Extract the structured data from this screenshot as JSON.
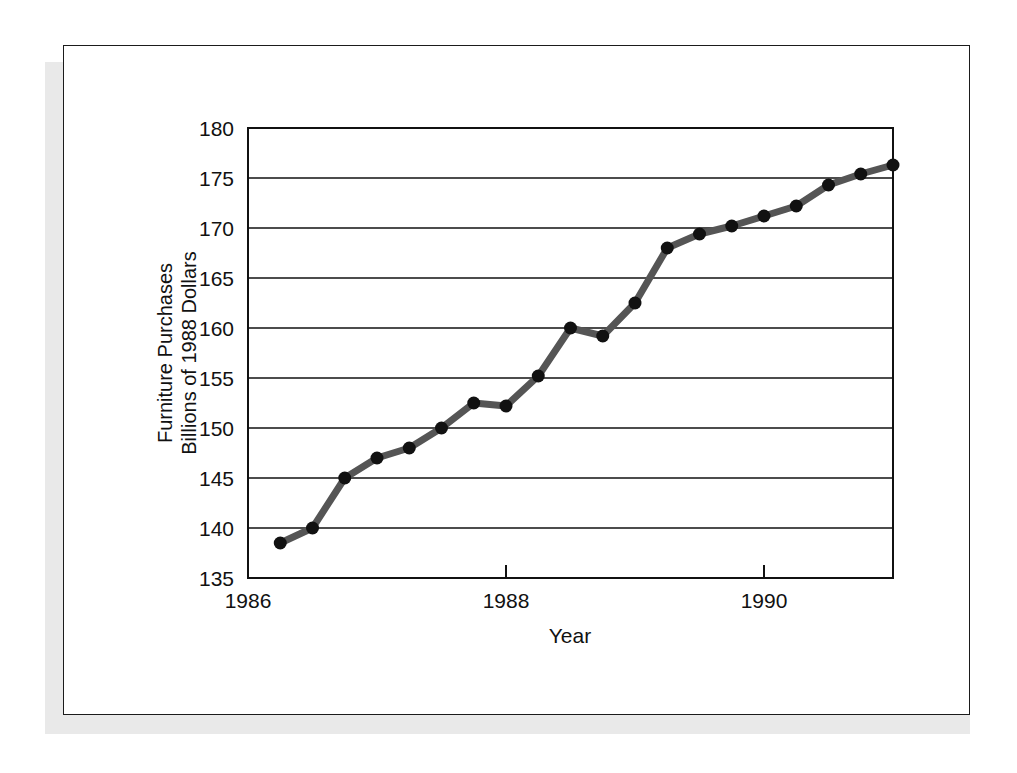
{
  "chart_data": {
    "type": "line",
    "title": "",
    "subtitle": "",
    "xlabel": "Year",
    "ylabel": "Furniture Purchases\nBillions of 1988 Dollars",
    "ylabel_line1": "Furniture Purchases",
    "ylabel_line2": "Billions of 1988 Dollars",
    "xlim": [
      1986.0,
      1991.0
    ],
    "ylim": [
      135,
      180
    ],
    "xticks": [
      1986,
      1988,
      1990
    ],
    "xtick_labels": [
      "1986",
      "1988",
      "1990"
    ],
    "yticks": [
      135,
      140,
      145,
      150,
      155,
      160,
      165,
      170,
      175,
      180
    ],
    "ytick_labels": [
      "135",
      "140",
      "145",
      "150",
      "155",
      "160",
      "165",
      "170",
      "175",
      "180"
    ],
    "grid": "horizontal",
    "legend": "none",
    "series": [
      {
        "name": "Furniture Purchases",
        "line_color": "#555555",
        "marker_color": "#111111",
        "marker": "circle",
        "x": [
          1986.25,
          1986.5,
          1986.75,
          1987.0,
          1987.25,
          1987.5,
          1987.75,
          1988.0,
          1988.25,
          1988.5,
          1988.75,
          1989.0,
          1989.25,
          1989.5,
          1989.75,
          1990.0,
          1990.25,
          1990.5,
          1990.75,
          1991.0
        ],
        "values": [
          138.5,
          140.0,
          145.0,
          147.0,
          148.0,
          150.0,
          152.5,
          152.2,
          155.2,
          160.0,
          159.2,
          162.5,
          168.0,
          169.4,
          170.2,
          171.2,
          172.2,
          174.3,
          175.4,
          176.3
        ]
      }
    ]
  },
  "colors": {
    "line": "#555555",
    "marker": "#111111",
    "axis": "#111111",
    "grid": "#111111",
    "frame": "#1b1b1b",
    "shadow": "#e9e9e9",
    "background": "#ffffff"
  }
}
